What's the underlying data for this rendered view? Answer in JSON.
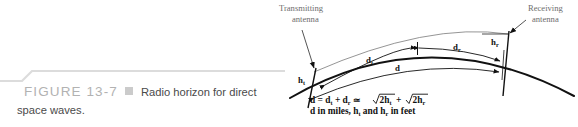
{
  "figure": {
    "number_label": "FIGURE 13-7",
    "caption_line_1": "Radio horizon for direct",
    "caption_line_2": "space waves.",
    "bullet_color": "#cbcbcb",
    "number_color": "#b2b2b2",
    "caption_color": "#4a4a4a",
    "rule_color": "#dcdcdc"
  },
  "diagram": {
    "title_labels": {
      "transmitting_line_1": "Transmitting",
      "transmitting_line_2": "antenna",
      "receiving_line_1": "Receiving",
      "receiving_line_2": "antenna"
    },
    "height_labels": {
      "transmit_height": "h",
      "transmit_height_sub": "t",
      "receive_height": "h",
      "receive_height_sub": "r"
    },
    "distance_labels": {
      "d_transmit": "d",
      "d_transmit_sub": "t",
      "d_receive": "d",
      "d_receive_sub": "r",
      "d_total": "d"
    },
    "formula": {
      "line_1_part_1": "d = d",
      "line_1_sub_1": "t",
      "line_1_part_2": " + d",
      "line_1_sub_2": "r",
      "line_1_part_3": " ≃ ",
      "line_1_radical_1": "2h",
      "line_1_radical_1_sub": "t",
      "line_1_plus": " + ",
      "line_1_radical_2": "2h",
      "line_1_radical_2_sub": "r",
      "line_2_part_1": "d in miles, h",
      "line_2_sub_1": "t",
      "line_2_part_2": " and h",
      "line_2_sub_2": "r",
      "line_2_part_3": " in feet"
    },
    "colors": {
      "earth_curve": "#111111",
      "thin_line": "#6b6b6b",
      "label_gray": "#6e6e6e",
      "ink": "#111111"
    }
  }
}
